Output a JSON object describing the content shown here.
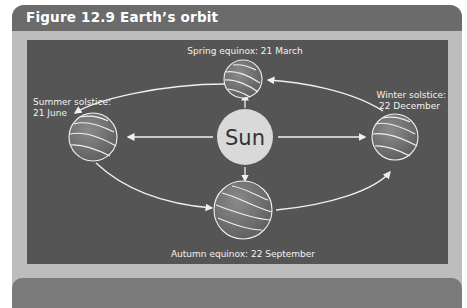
{
  "figure": {
    "title": "Figure 12.9 Earth’s orbit",
    "center": {
      "label": "Sun"
    },
    "positions": [
      {
        "id": "spring",
        "line1": "Spring equinox: 21 March",
        "line2": ""
      },
      {
        "id": "summer",
        "line1": "Summer solstice:",
        "line2": "21 June"
      },
      {
        "id": "winter",
        "line1": "Winter solstice:",
        "line2": "22 December"
      },
      {
        "id": "autumn",
        "line1": "Autumn equinox: 22 September",
        "line2": ""
      }
    ],
    "colors": {
      "header": "#6b6b6b",
      "frame": "#bdbdbd",
      "panel": "#555555",
      "sun": "#d9d9d9",
      "earth": "#6e6e6e",
      "lines": "#f0f0f0"
    }
  }
}
